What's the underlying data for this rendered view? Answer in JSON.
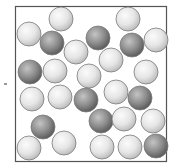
{
  "diagram": {
    "title": "",
    "colors": {
      "frame": "#555555",
      "light_particle": "#e6e6e6",
      "light_particle_highlight": "#fbfbfb",
      "light_particle_shadow": "#b8b8b8",
      "dark_particle": "#8c8c8c",
      "dark_particle_highlight": "#c4c4c4",
      "dark_particle_shadow": "#555555",
      "outline": "#7a7a7a"
    },
    "counts": {
      "light": 19,
      "dark": 9,
      "total": 28
    },
    "particles": [
      {
        "kind": "light",
        "col": 0.3,
        "row": 0.09
      },
      {
        "kind": "light",
        "col": 0.74,
        "row": 0.09
      },
      {
        "kind": "light",
        "col": 0.09,
        "row": 0.18
      },
      {
        "kind": "dark",
        "col": 0.24,
        "row": 0.24
      },
      {
        "kind": "dark",
        "col": 0.55,
        "row": 0.21
      },
      {
        "kind": "dark",
        "col": 0.77,
        "row": 0.25
      },
      {
        "kind": "light",
        "col": 0.93,
        "row": 0.22
      },
      {
        "kind": "light",
        "col": 0.4,
        "row": 0.29
      },
      {
        "kind": "light",
        "col": 0.63,
        "row": 0.35
      },
      {
        "kind": "dark",
        "col": 0.1,
        "row": 0.42
      },
      {
        "kind": "light",
        "col": 0.26,
        "row": 0.42
      },
      {
        "kind": "light",
        "col": 0.49,
        "row": 0.45
      },
      {
        "kind": "light",
        "col": 0.86,
        "row": 0.42
      },
      {
        "kind": "light",
        "col": 0.11,
        "row": 0.6
      },
      {
        "kind": "light",
        "col": 0.3,
        "row": 0.58
      },
      {
        "kind": "dark",
        "col": 0.47,
        "row": 0.6
      },
      {
        "kind": "light",
        "col": 0.66,
        "row": 0.55
      },
      {
        "kind": "dark",
        "col": 0.82,
        "row": 0.59
      },
      {
        "kind": "dark",
        "col": 0.19,
        "row": 0.78
      },
      {
        "kind": "dark",
        "col": 0.57,
        "row": 0.74
      },
      {
        "kind": "light",
        "col": 0.72,
        "row": 0.72
      },
      {
        "kind": "light",
        "col": 0.91,
        "row": 0.74
      },
      {
        "kind": "light",
        "col": 0.09,
        "row": 0.91
      },
      {
        "kind": "light",
        "col": 0.32,
        "row": 0.88
      },
      {
        "kind": "light",
        "col": 0.57,
        "row": 0.91
      },
      {
        "kind": "light",
        "col": 0.76,
        "row": 0.91
      },
      {
        "kind": "dark",
        "col": 0.93,
        "row": 0.9
      },
      {
        "kind": "light",
        "col": 0.22,
        "row": 0.03
      }
    ]
  }
}
